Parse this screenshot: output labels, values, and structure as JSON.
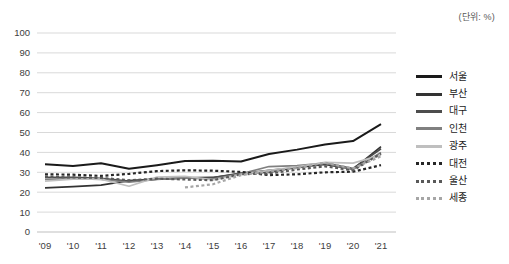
{
  "unit_note": "(단위: %)",
  "chart_data": {
    "type": "line",
    "title": "",
    "xlabel": "",
    "ylabel": "",
    "unit": "%",
    "grid": true,
    "legend_position": "right",
    "ylim": [
      0,
      100
    ],
    "yticks": [
      "0",
      "10",
      "20",
      "30",
      "40",
      "50",
      "60",
      "70",
      "80",
      "90",
      "100"
    ],
    "categories": [
      "'09",
      "'10",
      "'11",
      "'12",
      "'13",
      "'14",
      "'15",
      "'16",
      "'17",
      "'18",
      "'19",
      "'20",
      "'21"
    ],
    "series": [
      {
        "name": "서울",
        "color": "#1a1a1a",
        "style": "solid",
        "width": 2.0,
        "values": [
          34.0,
          33.2,
          34.5,
          31.8,
          33.6,
          35.7,
          35.8,
          35.4,
          39.2,
          41.4,
          44.0,
          45.7,
          54.2
        ]
      },
      {
        "name": "부산",
        "color": "#333333",
        "style": "solid",
        "width": 1.7,
        "values": [
          22.2,
          22.8,
          23.6,
          25.8,
          26.6,
          27.2,
          27.4,
          29.4,
          31.0,
          32.4,
          34.0,
          31.6,
          42.9
        ]
      },
      {
        "name": "대구",
        "color": "#4d4d4d",
        "style": "solid",
        "width": 1.7,
        "values": [
          27.5,
          27.5,
          27.0,
          25.6,
          26.6,
          27.0,
          27.3,
          29.6,
          30.0,
          32.6,
          34.6,
          31.9,
          41.8
        ]
      },
      {
        "name": "인천",
        "color": "#808080",
        "style": "solid",
        "width": 1.7,
        "values": [
          26.4,
          26.8,
          26.4,
          25.0,
          26.4,
          27.2,
          26.6,
          29.2,
          32.9,
          33.4,
          34.6,
          31.4,
          40.0
        ]
      },
      {
        "name": "광주",
        "color": "#bfbfbf",
        "style": "solid",
        "width": 1.7,
        "values": [
          25.6,
          26.6,
          26.6,
          23.0,
          27.6,
          28.0,
          26.2,
          29.0,
          31.0,
          32.8,
          35.0,
          34.6,
          38.6
        ]
      },
      {
        "name": "대전",
        "color": "#262626",
        "style": "dotted",
        "width": 2.2,
        "values": [
          29.0,
          28.8,
          28.2,
          29.2,
          30.6,
          31.0,
          30.8,
          30.2,
          28.6,
          29.0,
          30.0,
          30.3,
          33.6
        ]
      },
      {
        "name": "울산",
        "color": "#595959",
        "style": "dotted",
        "width": 2.2,
        "values": [
          27.8,
          27.4,
          27.2,
          26.0,
          26.8,
          26.4,
          26.0,
          29.0,
          29.4,
          31.4,
          33.0,
          31.0,
          39.4
        ]
      },
      {
        "name": "세종",
        "color": "#a6a6a6",
        "style": "dotted",
        "width": 2.2,
        "values": [
          null,
          null,
          null,
          null,
          null,
          22.4,
          24.0,
          28.6,
          30.4,
          32.2,
          34.8,
          32.0,
          38.0
        ]
      }
    ]
  }
}
